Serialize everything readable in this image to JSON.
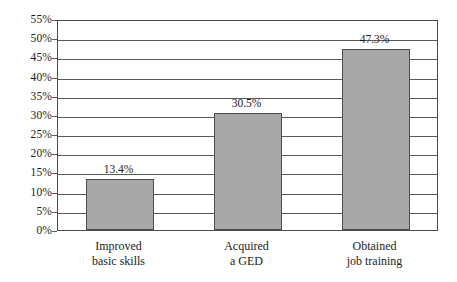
{
  "chart_data": {
    "type": "bar",
    "title": "",
    "subtitle": "",
    "xlabel": "",
    "ylabel": "",
    "categories": [
      "Improved basic skills",
      "Acquired a GED",
      "Obtained job training"
    ],
    "category_lines": [
      [
        "Improved",
        "basic skills"
      ],
      [
        "Acquired",
        "a GED"
      ],
      [
        "Obtained",
        "job training"
      ]
    ],
    "values": [
      13.4,
      30.5,
      47.3
    ],
    "value_labels": [
      "13.4%",
      "30.5%",
      "47.3%"
    ],
    "ylim": [
      0,
      55
    ],
    "ytick_step": 5,
    "ytick_labels": [
      "0%",
      "5%",
      "10%",
      "15%",
      "20%",
      "25%",
      "30%",
      "35%",
      "40%",
      "45%",
      "50%",
      "55%"
    ],
    "ytick_values": [
      0,
      5,
      10,
      15,
      20,
      25,
      30,
      35,
      40,
      45,
      50,
      55
    ],
    "grid": true,
    "grid_orientation": "horizontal",
    "legend": false,
    "legend_position": "none",
    "bar_fill_color": "#a8a8a8",
    "bar_edge_color": "#4c4c4c",
    "grid_color": "#5a5a5a",
    "frame_color": "#4a4a4a",
    "text_color": "#1c1c1c",
    "background_color": "#ffffff"
  }
}
